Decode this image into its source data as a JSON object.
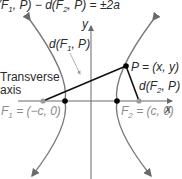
{
  "equation": {
    "text": "d(F1, P) − d(F2, P) = ±2a",
    "parts": [
      "(F",
      "1",
      ", P) − d(F",
      "2",
      ", P) = ±2a"
    ]
  },
  "axes": {
    "x_label": "x",
    "y_label": "y"
  },
  "labels": {
    "d_f1_p": {
      "pre": "d(F",
      "sub": "1",
      "post": ", P)"
    },
    "d_f2_p": {
      "pre": "d(F",
      "sub": "2",
      "post": ", P)"
    },
    "point_p": "P = (x, y)",
    "transverse_line1": "Transverse",
    "transverse_line2": "axis",
    "focus1": {
      "pre": "F",
      "sub": "1",
      "post": " = (−c, 0)"
    },
    "focus2": {
      "pre": "F",
      "sub": "2",
      "post": " = (c, 0)"
    }
  },
  "colors": {
    "curve": "#7a7a7a",
    "axis": "#6a6a6a",
    "segment": "#111111",
    "vertex": "#000000",
    "focus": "#8c8c8c",
    "text": "#2b2b2b"
  }
}
